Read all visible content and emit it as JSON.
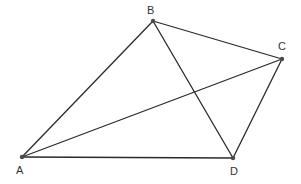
{
  "diagram": {
    "type": "quadrilateral-with-diagonals",
    "colors": {
      "line": "#2a2a2a",
      "point": "#4a4a4a",
      "label": "#333333",
      "background": "#ffffff"
    },
    "points": [
      {
        "id": "A",
        "label": "A",
        "x": 22,
        "y": 157,
        "label_x": 16,
        "label_y": 174
      },
      {
        "id": "B",
        "label": "B",
        "x": 153,
        "y": 21,
        "label_x": 147,
        "label_y": 14
      },
      {
        "id": "C",
        "label": "C",
        "x": 282,
        "y": 59,
        "label_x": 278,
        "label_y": 50
      },
      {
        "id": "D",
        "label": "D",
        "x": 233,
        "y": 158,
        "label_x": 230,
        "label_y": 175
      }
    ],
    "segments": [
      {
        "from": "A",
        "to": "B"
      },
      {
        "from": "B",
        "to": "C"
      },
      {
        "from": "C",
        "to": "D"
      },
      {
        "from": "D",
        "to": "A"
      },
      {
        "from": "A",
        "to": "C"
      },
      {
        "from": "B",
        "to": "D"
      }
    ]
  }
}
